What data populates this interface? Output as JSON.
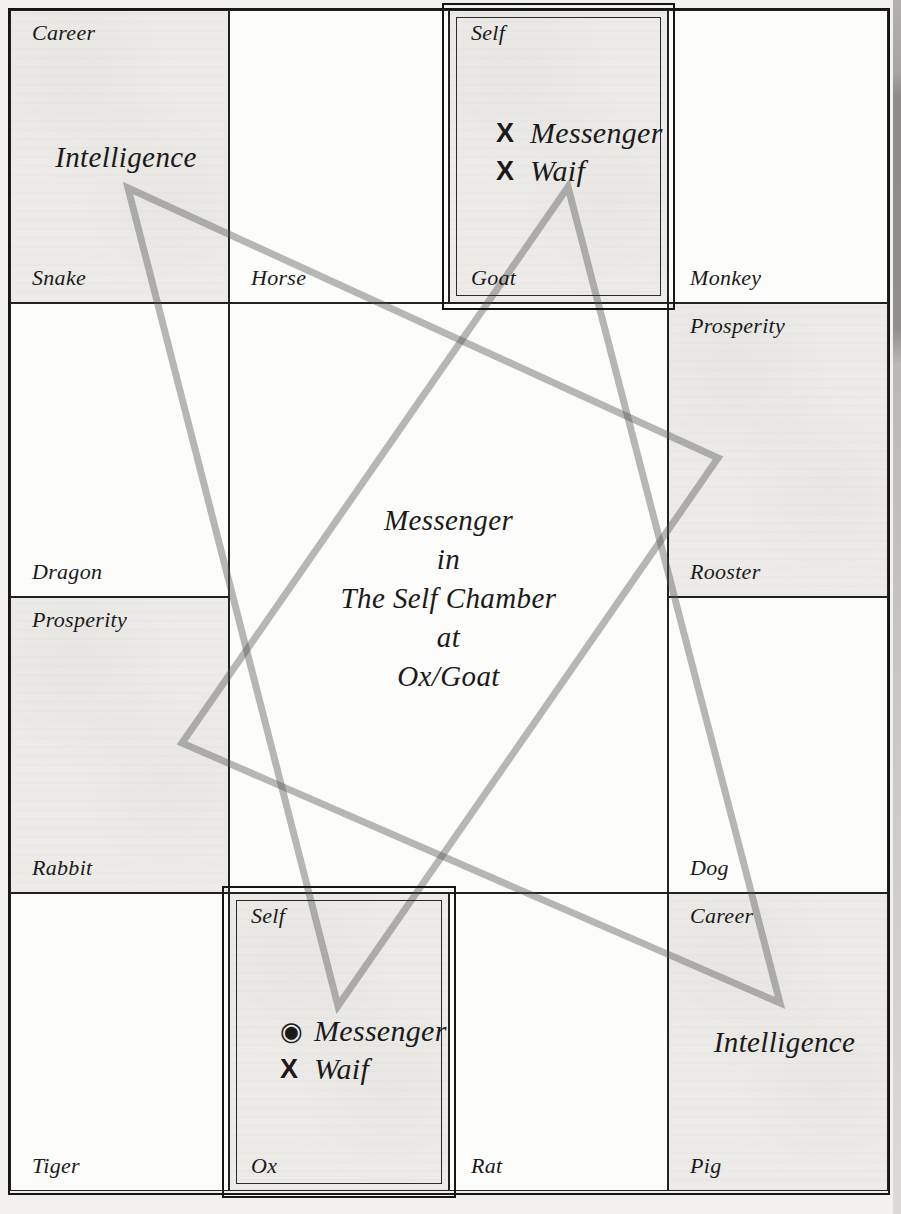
{
  "center": {
    "lines": [
      "Messenger",
      "in",
      "The Self Chamber",
      "at",
      "Ox/Goat"
    ]
  },
  "palaces": [
    {
      "branch": "Snake",
      "house": "Career",
      "big_label": "Intelligence",
      "shaded": true,
      "stars": []
    },
    {
      "branch": "Horse",
      "house": "",
      "big_label": "",
      "shaded": false,
      "stars": []
    },
    {
      "branch": "Goat",
      "house": "Self",
      "big_label": "",
      "shaded": true,
      "highlighted": true,
      "stars": [
        {
          "marker": "x-mark",
          "glyph": "X",
          "name": "Messenger"
        },
        {
          "marker": "x-mark",
          "glyph": "X",
          "name": "Waif"
        }
      ]
    },
    {
      "branch": "Monkey",
      "house": "",
      "big_label": "",
      "shaded": false,
      "stars": []
    },
    {
      "branch": "Dragon",
      "house": "",
      "big_label": "",
      "shaded": false,
      "stars": []
    },
    {
      "branch": "Rooster",
      "house": "Prosperity",
      "big_label": "",
      "shaded": true,
      "stars": []
    },
    {
      "branch": "Rabbit",
      "house": "Prosperity",
      "big_label": "",
      "shaded": true,
      "stars": []
    },
    {
      "branch": "Dog",
      "house": "",
      "big_label": "",
      "shaded": false,
      "stars": []
    },
    {
      "branch": "Tiger",
      "house": "",
      "big_label": "",
      "shaded": false,
      "stars": []
    },
    {
      "branch": "Ox",
      "house": "Self",
      "big_label": "",
      "shaded": true,
      "highlighted": true,
      "stars": [
        {
          "marker": "bullseye",
          "glyph": "◉",
          "name": "Messenger"
        },
        {
          "marker": "x-mark",
          "glyph": "X",
          "name": "Waif"
        }
      ]
    },
    {
      "branch": "Rat",
      "house": "",
      "big_label": "",
      "shaded": false,
      "stars": []
    },
    {
      "branch": "Pig",
      "house": "Career",
      "big_label": "Intelligence",
      "shaded": true,
      "stars": []
    }
  ],
  "colors": {
    "page_bg": "#f2f1ee",
    "shaded_cell": "#ecebe8",
    "plain_cell": "#fcfcfa",
    "grid_line": "#161616",
    "aspect_line_gray": "#a8a8a8",
    "text": "#1a1a1a"
  }
}
